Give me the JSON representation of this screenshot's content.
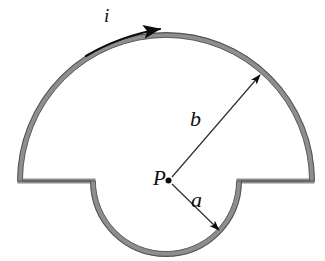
{
  "figure": {
    "type": "physics-diagram",
    "background_color": "#ffffff",
    "wire_color": "#8c8c8c",
    "wire_outline_color": "#4a4a4a",
    "annotation_color": "#0d0d0d",
    "labels": {
      "current": "i",
      "outer_radius": "b",
      "inner_radius": "a",
      "center_point": "P"
    },
    "geometry": {
      "center_x": 166,
      "center_y": 181,
      "outer_radius_px": 146,
      "inner_radius_px": 74,
      "outer_arc_sweep_deg": 180,
      "inner_arc_sweep_deg": 180,
      "current_direction": "clockwise-along-outer-arc-to-the-right"
    },
    "elements": {
      "outer_arc_name": "outer-semicircular-wire-arc",
      "inner_arc_name": "inner-semicircular-notch-arc",
      "left_straight_name": "left-radial-wire-segment",
      "right_straight_name": "right-radial-wire-segment",
      "current_arrow_name": "current-direction-arrow",
      "radius_b_arrow_name": "outer-radius-arrow",
      "radius_a_arrow_name": "inner-radius-arrow",
      "center_dot_name": "center-point-dot"
    }
  }
}
